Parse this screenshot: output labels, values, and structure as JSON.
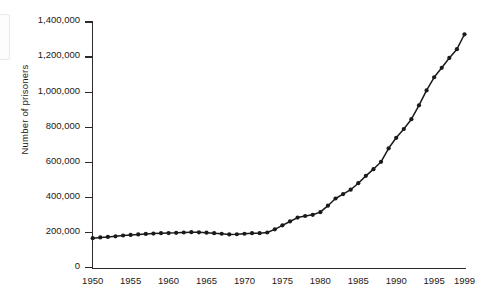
{
  "chart_data": {
    "type": "line",
    "title": "",
    "xlabel": "",
    "ylabel": "Number of prisoners",
    "xlim": [
      1950,
      1999
    ],
    "ylim": [
      0,
      1400000
    ],
    "grid": false,
    "legend": null,
    "x_ticks": [
      1950,
      1955,
      1960,
      1965,
      1970,
      1975,
      1980,
      1985,
      1990,
      1995,
      1999
    ],
    "x_tick_labels": [
      "1950",
      "1955",
      "1960",
      "1965",
      "1970",
      "1975",
      "1980",
      "1985",
      "1990",
      "1995",
      "1999"
    ],
    "y_ticks": [
      0,
      200000,
      400000,
      600000,
      800000,
      1000000,
      1200000,
      1400000
    ],
    "y_tick_labels": [
      "0",
      "200,000",
      "400,000",
      "600,000",
      "800,000",
      "1,000,000",
      "1,200,000",
      "1,400,000"
    ],
    "marker": "filled-circle",
    "line_color": "#1a1a1a",
    "series": [
      {
        "name": "Number of prisoners",
        "x": [
          1950,
          1951,
          1952,
          1953,
          1954,
          1955,
          1956,
          1957,
          1958,
          1959,
          1960,
          1961,
          1962,
          1963,
          1964,
          1965,
          1966,
          1967,
          1968,
          1969,
          1970,
          1971,
          1972,
          1973,
          1974,
          1975,
          1976,
          1977,
          1978,
          1979,
          1980,
          1981,
          1982,
          1983,
          1984,
          1985,
          1986,
          1987,
          1988,
          1989,
          1990,
          1991,
          1992,
          1993,
          1994,
          1995,
          1996,
          1997,
          1998,
          1999
        ],
        "values": [
          168000,
          172000,
          175000,
          178000,
          183000,
          186000,
          189000,
          192000,
          194000,
          196000,
          197000,
          198000,
          200000,
          202000,
          201000,
          199000,
          196000,
          193000,
          189000,
          190000,
          193000,
          196000,
          196000,
          200000,
          218000,
          241000,
          263000,
          285000,
          294000,
          301000,
          316000,
          353000,
          394000,
          419000,
          444000,
          481000,
          523000,
          561000,
          603000,
          680000,
          740000,
          790000,
          846000,
          925000,
          1010000,
          1085000,
          1139000,
          1195000,
          1245000,
          1330000
        ]
      }
    ]
  }
}
